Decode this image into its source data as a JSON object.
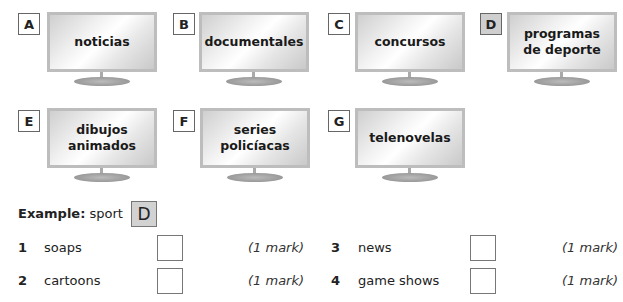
{
  "options": [
    {
      "letter": "A",
      "label_lines": [
        "noticias"
      ],
      "shaded": false
    },
    {
      "letter": "B",
      "label_lines": [
        "documentales"
      ],
      "shaded": false
    },
    {
      "letter": "C",
      "label_lines": [
        "concursos"
      ],
      "shaded": false
    },
    {
      "letter": "D",
      "label_lines": [
        "programas",
        "de deporte"
      ],
      "shaded": true
    },
    {
      "letter": "E",
      "label_lines": [
        "dibujos",
        "animados"
      ],
      "shaded": false
    },
    {
      "letter": "F",
      "label_lines": [
        "series",
        "policíacas"
      ],
      "shaded": false
    },
    {
      "letter": "G",
      "label_lines": [
        "telenovelas"
      ],
      "shaded": false
    }
  ],
  "example": {
    "prefix": "Example:",
    "word": "sport",
    "answer": "D"
  },
  "questions": [
    {
      "number": "1",
      "word": "soaps",
      "answer": "",
      "mark": "(1 mark)"
    },
    {
      "number": "2",
      "word": "cartoons",
      "answer": "",
      "mark": "(1 mark)"
    },
    {
      "number": "3",
      "word": "news",
      "answer": "",
      "mark": "(1 mark)"
    },
    {
      "number": "4",
      "word": "game shows",
      "answer": "",
      "mark": "(1 mark)"
    }
  ]
}
